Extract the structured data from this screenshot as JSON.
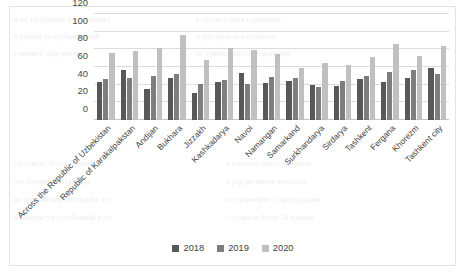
{
  "chart_data": {
    "type": "bar",
    "title": "",
    "xlabel": "",
    "ylabel": "",
    "ylim": [
      0,
      120
    ],
    "yticks": [
      0,
      20,
      40,
      60,
      80,
      100,
      120
    ],
    "grid": true,
    "legend_position": "bottom",
    "categories": [
      "Across the Republic of Uzbekistan",
      "Republic of Karakalpakstan",
      "Andijan",
      "Bukhara",
      "Jizzakh",
      "Kashkadarya",
      "Navoi",
      "Namangan",
      "Samarkand",
      "Surkhandarya",
      "Sirdarya",
      "Tashkent",
      "Fergana",
      "Khorezm",
      "Tashkent city"
    ],
    "series": [
      {
        "name": "2018",
        "color": "#585858",
        "values": [
          43,
          57,
          35,
          48,
          31,
          43,
          53,
          42,
          44,
          40,
          38,
          46,
          43,
          47,
          59
        ]
      },
      {
        "name": "2019",
        "color": "#7e7e7e",
        "values": [
          46,
          47,
          50,
          52,
          41,
          45,
          41,
          49,
          47,
          37,
          44,
          50,
          54,
          57,
          52
        ]
      },
      {
        "name": "2020",
        "color": "#c0c0c0",
        "values": [
          76,
          78,
          81,
          96,
          68,
          82,
          79,
          75,
          59,
          65,
          62,
          71,
          86,
          73,
          84
        ]
      }
    ]
  },
  "legend": {
    "items": [
      {
        "label": "2018",
        "color": "#585858"
      },
      {
        "label": "2019",
        "color": "#7e7e7e"
      },
      {
        "label": "2020",
        "color": "#c0c0c0"
      }
    ]
  },
  "background_text": {
    "lines": [
      "и на заседаниях и в решениях",
      "в рамках республиканской",
      "ственной программы",
      "в соответствии с данными",
      "и ряд регионов показали",
      "по сравнению с предыдущим",
      "составило более 20 единиц",
      "что отражено в таблице",
      "на протяжении последних лет",
      "наблюдается устойчивый рост"
    ]
  }
}
